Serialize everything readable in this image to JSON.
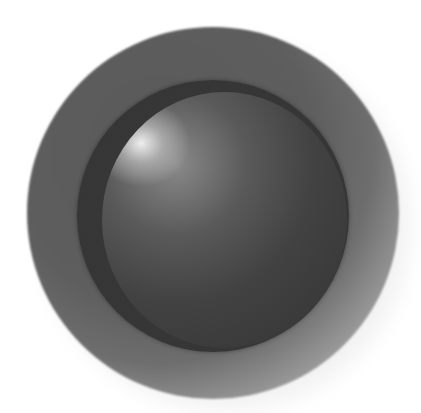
{
  "graphic": {
    "description": "Glossy dark sphere button set in a recessed circular disc",
    "colors": {
      "background": "#ffffff",
      "outer_disc": "#5e5e5e",
      "outer_disc_fade": "#cfcfcf",
      "sphere_ring": "#353535",
      "sphere_body": "#3a3a3a",
      "highlight": "#f0f0f0"
    }
  }
}
